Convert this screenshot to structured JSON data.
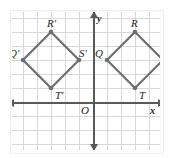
{
  "figure": {
    "type": "coordinate-grid-reflection",
    "background_color": "#ffffff",
    "grid_color": "#d8d8d8",
    "axis_color": "#58595b",
    "shape_color": "#6d6e71",
    "label_color": "#231f20"
  },
  "axes": {
    "x_label": "x",
    "y_label": "y",
    "origin_label": "O",
    "origin_px": {
      "x": 81,
      "y": 90
    },
    "cell_px": 14,
    "x_range": [
      -6,
      5
    ],
    "y_range": [
      -3,
      6
    ]
  },
  "chart_data": {
    "type": "scatter",
    "title": "",
    "xlabel": "x",
    "ylabel": "y",
    "grid": true,
    "legend": "none",
    "xlim": [
      -6,
      5
    ],
    "ylim": [
      -3,
      6
    ],
    "series": [
      {
        "name": "Quadrilateral QRST",
        "closed": true,
        "points": [
          {
            "label": "Q",
            "x": 1,
            "y": 3
          },
          {
            "label": "R",
            "x": 3,
            "y": 5
          },
          {
            "label": "S",
            "x": 5,
            "y": 3
          },
          {
            "label": "T",
            "x": 3,
            "y": 1
          }
        ]
      },
      {
        "name": "Quadrilateral Q'R'S'T'",
        "closed": true,
        "points": [
          {
            "label": "Q'",
            "x": -5,
            "y": 3
          },
          {
            "label": "R'",
            "x": -3,
            "y": 5
          },
          {
            "label": "S'",
            "x": -1,
            "y": 3
          },
          {
            "label": "T'",
            "x": -3,
            "y": 1
          }
        ]
      }
    ]
  },
  "labels": {
    "q_prime": "Q'",
    "r_prime": "R'",
    "s_prime": "S'",
    "t_prime": "T'",
    "q": "Q",
    "r": "R",
    "s": "S",
    "t": "T",
    "origin": "O",
    "x_axis": "x",
    "y_axis": "y"
  }
}
